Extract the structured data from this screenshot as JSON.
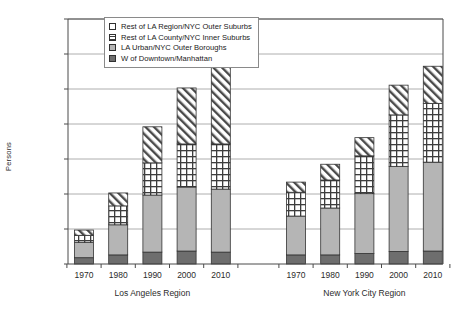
{
  "chart_data": {
    "type": "bar",
    "subtype": "stacked-grouped",
    "title": "",
    "xlabel": "",
    "ylabel": "Persons",
    "ylim": [
      0,
      7000000
    ],
    "ytick_step": 1000000,
    "ytick_labels": [
      "0",
      "1,000,000",
      "2,000,000",
      "3,000,000",
      "4,000,000",
      "5,000,000",
      "6,000,000",
      "7,000,000"
    ],
    "ytick_values": [
      0,
      1000000,
      2000000,
      3000000,
      4000000,
      5000000,
      6000000,
      7000000
    ],
    "grid": true,
    "grid_axis": "y",
    "legend_position": "top-center",
    "categories": [
      "1970",
      "1980",
      "1990",
      "2000",
      "2010"
    ],
    "groups": [
      {
        "name": "Los Angeles Region",
        "categories": [
          "1970",
          "1980",
          "1990",
          "2000",
          "2010"
        ],
        "totals": [
          970000,
          2030000,
          3920000,
          5030000,
          5630000
        ]
      },
      {
        "name": "New York City Region",
        "categories": [
          "1970",
          "1980",
          "1990",
          "2000",
          "2010"
        ],
        "totals": [
          2340000,
          2850000,
          3610000,
          5110000,
          5650000
        ]
      }
    ],
    "series": [
      {
        "name": "W of Downtown/Manhattan",
        "pattern": "solid-dark-gray",
        "color": "#6e6e6e",
        "stack_order": 0,
        "values_by_group": {
          "Los Angeles Region": [
            180000,
            260000,
            340000,
            370000,
            340000
          ],
          "New York City Region": [
            260000,
            260000,
            300000,
            360000,
            370000
          ]
        }
      },
      {
        "name": "LA Urban/NYC Outer Boroughs",
        "pattern": "solid-light-gray",
        "color": "#b5b5b5",
        "stack_order": 1,
        "values_by_group": {
          "Los Angeles Region": [
            440000,
            860000,
            1630000,
            1830000,
            1800000
          ],
          "New York City Region": [
            1110000,
            1340000,
            1710000,
            2430000,
            2540000
          ]
        }
      },
      {
        "name": "Rest of LA County/NYC Inner Suburbs",
        "pattern": "crosshatch-grid",
        "color": "#ffffff",
        "stack_order": 2,
        "values_by_group": {
          "Los Angeles Region": [
            200000,
            540000,
            920000,
            1230000,
            1290000
          ],
          "New York City Region": [
            680000,
            800000,
            1080000,
            1470000,
            1680000
          ]
        }
      },
      {
        "name": "Rest of LA Region/NYC Outer Suburbs",
        "pattern": "diagonal-hatch",
        "color": "#ffffff",
        "stack_order": 3,
        "values_by_group": {
          "Los Angeles Region": [
            150000,
            370000,
            1030000,
            1600000,
            2200000
          ],
          "New York City Region": [
            290000,
            450000,
            520000,
            850000,
            1060000
          ]
        }
      }
    ],
    "legend_entries": [
      "Rest of LA Region/NYC Outer Suburbs",
      "Rest of LA County/NYC Inner Suburbs",
      "LA Urban/NYC Outer Boroughs",
      "W of Downtown/Manhattan"
    ]
  },
  "axis": {
    "ylabel": "Persons"
  },
  "colors": {
    "dark_gray": "#6e6e6e",
    "light_gray": "#b5b5b5",
    "outline": "#333333",
    "grid": "#9a9a9a",
    "axis": "#4a4a4a"
  }
}
